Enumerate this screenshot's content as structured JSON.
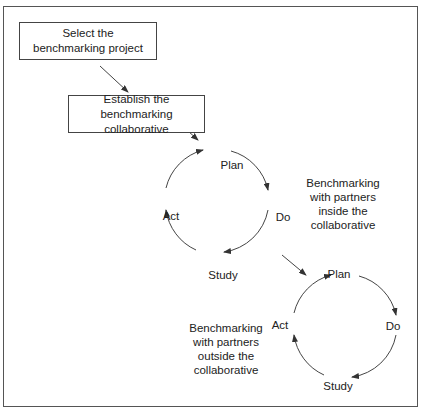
{
  "diagram": {
    "colors": {
      "stroke": "#444444",
      "text": "#222222",
      "frame": "#555555"
    },
    "boxes": [
      {
        "id": "select",
        "lines": [
          "Select the",
          "benchmarking project"
        ]
      },
      {
        "id": "establish",
        "lines": [
          "Establish the",
          "benchmarking collaborative"
        ]
      }
    ],
    "cycle_inside": {
      "labels": {
        "plan": "Plan",
        "do": "Do",
        "study": "Study",
        "act": "Act"
      },
      "note": [
        "Benchmarking",
        "with partners",
        "inside the",
        "collaborative"
      ]
    },
    "cycle_outside": {
      "labels": {
        "plan": "Plan",
        "do": "Do",
        "study": "Study",
        "act": "Act"
      },
      "note": [
        "Benchmarking",
        "with partners",
        "outside the",
        "collaborative"
      ]
    }
  }
}
